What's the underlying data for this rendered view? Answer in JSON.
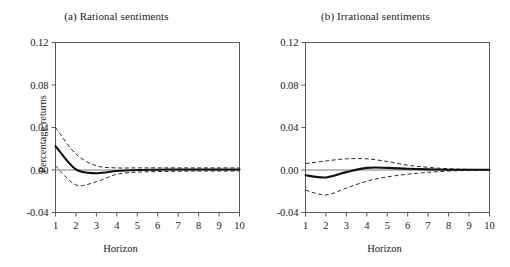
{
  "figure": {
    "panels": [
      {
        "id": "a",
        "title": "(a) Rational sentiments",
        "xlabel": "Horizon",
        "ylabel": "Percentage returns"
      },
      {
        "id": "b",
        "title": "(b) Irrational sentiments",
        "xlabel": "Horizon",
        "ylabel": "Percentage returns"
      }
    ],
    "ytick_labels": [
      "0.12",
      "0.08",
      "0.04",
      "0.00",
      "-0.04"
    ],
    "xtick_labels": [
      "1",
      "2",
      "3",
      "4",
      "5",
      "6",
      "7",
      "8",
      "9",
      "10"
    ],
    "colors": {
      "mean_line": "#111111",
      "band_line": "#2b2b2b",
      "axis": "#5a5a5a",
      "zero_line": "#6b6b6b",
      "background": "#ffffff"
    }
  },
  "chart_data": [
    {
      "type": "line",
      "title": "(a) Rational sentiments",
      "xlabel": "Horizon",
      "ylabel": "Percentage returns",
      "xlim": [
        1,
        10
      ],
      "ylim": [
        -0.04,
        0.12
      ],
      "yticks": [
        -0.04,
        0.0,
        0.04,
        0.08,
        0.12
      ],
      "xticks": [
        1,
        2,
        3,
        4,
        5,
        6,
        7,
        8,
        9,
        10
      ],
      "grid": false,
      "legend": "none",
      "x": [
        1,
        2,
        3,
        4,
        5,
        6,
        7,
        8,
        9,
        10
      ],
      "series": [
        {
          "name": "Impulse response (point estimate)",
          "style": "solid",
          "values": [
            0.0225,
            0.0005,
            -0.003,
            -0.001,
            0.0,
            0.0003,
            0.0005,
            0.0005,
            0.0005,
            0.0005
          ]
        },
        {
          "name": "Upper confidence band",
          "style": "dashed",
          "values": [
            0.04,
            0.015,
            0.004,
            0.002,
            0.002,
            0.002,
            0.002,
            0.002,
            0.002,
            0.002
          ]
        },
        {
          "name": "Lower confidence band",
          "style": "dashed",
          "values": [
            0.004,
            -0.014,
            -0.011,
            -0.004,
            -0.002,
            -0.0015,
            -0.0012,
            -0.001,
            -0.001,
            -0.001
          ]
        }
      ],
      "annotations": [
        "zero reference line at y = 0.00"
      ]
    },
    {
      "type": "line",
      "title": "(b) Irrational sentiments",
      "xlabel": "Horizon",
      "ylabel": "Percentage returns",
      "xlim": [
        1,
        10
      ],
      "ylim": [
        -0.04,
        0.12
      ],
      "yticks": [
        -0.04,
        0.0,
        0.04,
        0.08,
        0.12
      ],
      "xticks": [
        1,
        2,
        3,
        4,
        5,
        6,
        7,
        8,
        9,
        10
      ],
      "grid": false,
      "legend": "none",
      "x": [
        1,
        2,
        3,
        4,
        5,
        6,
        7,
        8,
        9,
        10
      ],
      "series": [
        {
          "name": "Impulse response (point estimate)",
          "style": "solid",
          "values": [
            -0.005,
            -0.007,
            -0.002,
            0.002,
            0.002,
            0.0012,
            0.0006,
            0.0003,
            0.0002,
            0.0002
          ]
        },
        {
          "name": "Upper confidence band",
          "style": "dashed",
          "values": [
            0.006,
            0.0085,
            0.0105,
            0.0105,
            0.008,
            0.0045,
            0.0025,
            0.0012,
            0.0006,
            0.0004
          ]
        },
        {
          "name": "Lower confidence band",
          "style": "dashed",
          "values": [
            -0.019,
            -0.0235,
            -0.017,
            -0.0105,
            -0.0065,
            -0.004,
            -0.0022,
            -0.001,
            -0.0004,
            0.0
          ]
        }
      ],
      "annotations": [
        "zero reference line at y = 0.00"
      ]
    }
  ]
}
